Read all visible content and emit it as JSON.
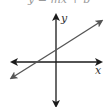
{
  "title": "y = mx + b",
  "axes": {
    "x_label": "x",
    "y_label": "y"
  },
  "line": {
    "description": "line with positive slope and positive y-intercept",
    "slope_sign": "positive",
    "y_intercept_sign": "positive"
  },
  "colors": {
    "axes": "#1a1a1a",
    "line": "#555555"
  }
}
